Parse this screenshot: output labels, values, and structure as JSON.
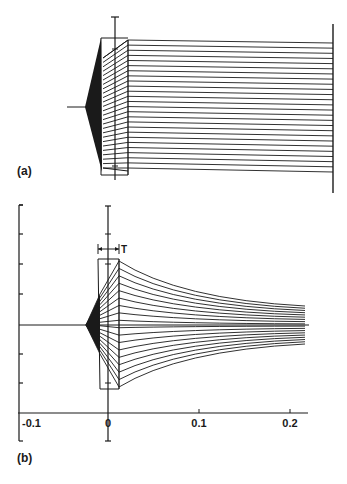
{
  "figure": {
    "panel_a": {
      "label": "(a)",
      "axis_x": 115,
      "axis_top": 17,
      "axis_bottom": 180,
      "center_y": 107,
      "h_axis_left": 67,
      "source_x": 85,
      "lens": {
        "x_front": 101,
        "x_back": 128,
        "y_top": 38,
        "y_bottom": 175,
        "front_top": 40,
        "front_bottom": 168
      },
      "screen": {
        "x": 333,
        "y_top": 24,
        "y_bottom": 193
      },
      "ray_count": 26,
      "ray_end_top": 43,
      "ray_end_bottom": 172,
      "ray_start_top": 40,
      "ray_start_bottom": 168
    },
    "panel_b": {
      "label": "(b)",
      "x_axis": {
        "y": 413,
        "x_start": 18,
        "x_end": 308,
        "ticks": [
          {
            "label": "-0.1",
            "x": 19
          },
          {
            "label": "0",
            "x": 108
          },
          {
            "label": "0.1",
            "x": 199
          },
          {
            "label": "0.2",
            "x": 290
          }
        ]
      },
      "left_axis": {
        "x": 19,
        "y_top": 205,
        "y_bottom": 441,
        "ticks_y": [
          205,
          234,
          264,
          294,
          354,
          383
        ]
      },
      "center_axis": {
        "x": 108,
        "y_top": 206,
        "y_bottom": 441
      },
      "center_y": 325,
      "source_x": 86,
      "lens": {
        "x_front": 98,
        "x_back": 119,
        "y_top": 259,
        "y_bottom": 389
      },
      "thickness_label": "T",
      "thickness_y": 249,
      "ray_count": 18,
      "ray_end_x": 305,
      "ray_end_top": 306,
      "ray_end_bottom": 344
    }
  }
}
